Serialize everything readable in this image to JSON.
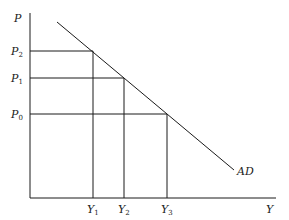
{
  "diagram": {
    "type": "aggregate-demand-curve",
    "axes": {
      "y_label": "P",
      "x_label": "Y"
    },
    "curve": {
      "label": "AD",
      "from": [
        57,
        22
      ],
      "to": [
        234,
        170
      ]
    },
    "price_levels": [
      {
        "label": "P",
        "sub": "2",
        "y": 51,
        "x_meet": 93
      },
      {
        "label": "P",
        "sub": "1",
        "y": 78,
        "x_meet": 124
      },
      {
        "label": "P",
        "sub": "0",
        "y": 114,
        "x_meet": 167
      }
    ],
    "output_levels": [
      {
        "label": "Y",
        "sub": "1",
        "x": 93
      },
      {
        "label": "Y",
        "sub": "2",
        "x": 124
      },
      {
        "label": "Y",
        "sub": "3",
        "x": 167
      }
    ],
    "origin": [
      30,
      198
    ],
    "x_axis_end": 276,
    "y_axis_top": 13
  }
}
